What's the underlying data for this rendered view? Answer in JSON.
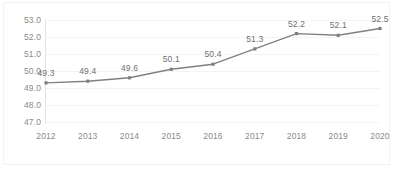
{
  "chart_data": {
    "type": "line",
    "title": "",
    "subtitle": "",
    "xlabel": "",
    "ylabel": "",
    "categories": [
      "2012",
      "2013",
      "2014",
      "2015",
      "2016",
      "2017",
      "2018",
      "2019",
      "2020"
    ],
    "values": [
      49.3,
      49.4,
      49.6,
      50.1,
      50.4,
      51.3,
      52.2,
      52.1,
      52.5
    ],
    "data_labels": [
      "49.3",
      "49.4",
      "49.6",
      "50.1",
      "50.4",
      "51.3",
      "52.2",
      "52.1",
      "52.5"
    ],
    "ylim": [
      47.0,
      53.0
    ],
    "ytick_step": 1.0,
    "ytick_labels": [
      "53.0",
      "52.0",
      "51.0",
      "50.0",
      "49.0",
      "48.0",
      "47.0"
    ],
    "ytick_values": [
      53.0,
      52.0,
      51.0,
      50.0,
      49.0,
      48.0,
      47.0
    ],
    "grid": true,
    "legend": "none",
    "series": [
      {
        "name": "",
        "values": [
          49.3,
          49.4,
          49.6,
          50.1,
          50.4,
          51.3,
          52.2,
          52.1,
          52.5
        ],
        "line_color": "#808080",
        "marker_color": "#808080",
        "marker": "square"
      }
    ],
    "colors": {
      "line": "#808080",
      "marker": "#808080",
      "gridline": "#f4f4f4",
      "axis": "#e3e3e3",
      "tick_text": "#8a8a8a",
      "label_text": "#6f6f6f",
      "background": "#ffffff",
      "border": "#f2f2f2"
    }
  }
}
